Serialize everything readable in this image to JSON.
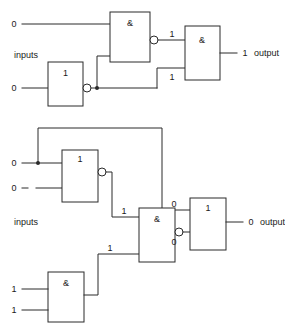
{
  "figure": {
    "background_color": "#ffffff",
    "line_color": "#2b2b2b",
    "text_color": "#1a1a1a"
  },
  "circuits": [
    {
      "id": "top-circuit",
      "inputs_label": "inputs",
      "output_label": "output",
      "input_values": [
        "0",
        "0"
      ],
      "output_value": "1",
      "internal_values": [
        "1",
        "1"
      ],
      "gates": [
        {
          "id": "top-nand",
          "symbol": "&",
          "type": "nand",
          "inverted": true
        },
        {
          "id": "top-inverter",
          "symbol": "1",
          "type": "inverter",
          "inverted": true
        },
        {
          "id": "top-and",
          "symbol": "&",
          "type": "and",
          "inverted": false
        }
      ]
    },
    {
      "id": "bottom-circuit",
      "inputs_label": "inputs",
      "output_label": "output",
      "input_values": [
        "0",
        "0",
        "1",
        "1"
      ],
      "output_value": "0",
      "internal_values": [
        "1",
        "1",
        "0",
        "0"
      ],
      "gates": [
        {
          "id": "bottom-nor",
          "symbol": "1",
          "type": "nor",
          "inverted": true
        },
        {
          "id": "bottom-nand",
          "symbol": "&",
          "type": "nand",
          "inverted": true
        },
        {
          "id": "bottom-and",
          "symbol": "&",
          "type": "and",
          "inverted": false
        },
        {
          "id": "bottom-or",
          "symbol": "1",
          "type": "or",
          "inverted": false
        }
      ]
    }
  ],
  "labels": {
    "top": {
      "in0": "0",
      "in1": "0",
      "inputs_word": "inputs",
      "nand_symbol": "&",
      "inv_symbol": "1",
      "and_symbol": "&",
      "mid_upper": "1",
      "mid_lower": "1",
      "out_value": "1",
      "output_word": "output"
    },
    "bottom": {
      "in0": "0",
      "in1": "0",
      "in2": "1",
      "in3": "1",
      "inputs_word": "inputs",
      "nor_symbol": "1",
      "nand_symbol": "&",
      "and_symbol": "&",
      "or_symbol": "1",
      "nor_out": "1",
      "and_out": "1",
      "fb_value": "0",
      "nand_out": "0",
      "out_value": "0",
      "output_word": "output"
    }
  }
}
